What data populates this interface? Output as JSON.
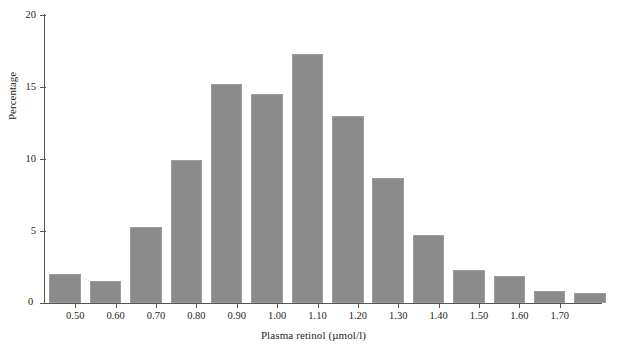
{
  "chart_data": {
    "type": "bar",
    "title": "",
    "xlabel": "Plasma retinol (µmol/l)",
    "ylabel": "Percentage",
    "xlim": [
      0.425,
      1.775
    ],
    "ylim": [
      0,
      20
    ],
    "grid": false,
    "legend": null,
    "bin_width": 0.1,
    "bar_color": "#8b8b8b",
    "axis_color": "#555555",
    "xticks": [
      "0.50",
      "0.60",
      "0.70",
      "0.80",
      "0.90",
      "1.00",
      "1.10",
      "1.20",
      "1.30",
      "1.40",
      "1.50",
      "1.60",
      "1.70"
    ],
    "xtick_values": [
      0.5,
      0.6,
      0.7,
      0.8,
      0.9,
      1.0,
      1.1,
      1.2,
      1.3,
      1.4,
      1.5,
      1.6,
      1.7
    ],
    "yticks": [
      "0",
      "5",
      "10",
      "15",
      "20"
    ],
    "ytick_values": [
      0,
      5,
      10,
      15,
      20
    ],
    "origin_label": "0",
    "categories": [
      "0.45",
      "0.55",
      "0.65",
      "0.75",
      "0.85",
      "0.95",
      "1.05",
      "1.15",
      "1.25",
      "1.35",
      "1.45",
      "1.55",
      "1.65",
      "1.75"
    ],
    "bin_centers": [
      0.475,
      0.575,
      0.675,
      0.775,
      0.875,
      0.975,
      1.075,
      1.175,
      1.275,
      1.375,
      1.475,
      1.575,
      1.675,
      1.775
    ],
    "values": [
      2.0,
      1.5,
      5.3,
      9.9,
      15.2,
      14.5,
      17.3,
      13.0,
      8.7,
      4.7,
      2.3,
      1.9,
      0.8,
      0.7
    ],
    "series": [
      {
        "name": "Percentage",
        "values": [
          2.0,
          1.5,
          5.3,
          9.9,
          15.2,
          14.5,
          17.3,
          13.0,
          8.7,
          4.7,
          2.3,
          1.9,
          0.8,
          0.7
        ]
      }
    ]
  },
  "figure": {
    "top_clipped_text": ""
  }
}
